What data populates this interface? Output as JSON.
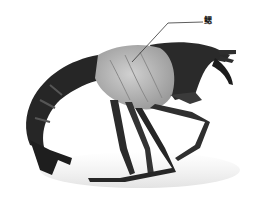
{
  "figure": {
    "annotation": {
      "label": "鳃",
      "meaning": "gills",
      "leader_line": {
        "from": [
          203,
          22
        ],
        "elbow": [
          168,
          23
        ],
        "to": [
          132,
          62
        ]
      }
    },
    "colors": {
      "background": "#ffffff",
      "body_dark": "#2a2a2a",
      "gill_area": "#b8b8b8",
      "leader_line": "#333333"
    }
  }
}
